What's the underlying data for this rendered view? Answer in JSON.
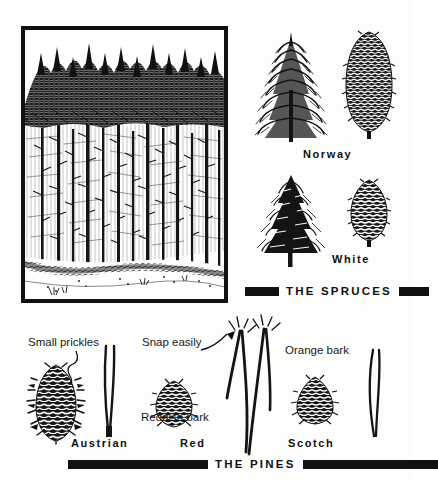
{
  "figure": {
    "kind": "field-guide-plate",
    "sections": [
      {
        "id": "spruces",
        "banner_text": "THE SPRUCES",
        "entries": [
          {
            "name": "Norway",
            "has_tree": true,
            "has_cone": true,
            "cone_shape": "long-cylindrical"
          },
          {
            "name": "White",
            "has_tree": true,
            "has_cone": true,
            "cone_shape": "short-ovoid"
          }
        ]
      },
      {
        "id": "pines",
        "banner_text": "THE PINES",
        "entries": [
          {
            "name": "Austrian",
            "has_cone": true,
            "has_needles": true,
            "annotation": "Small prickles"
          },
          {
            "name": "Red",
            "has_cone": true,
            "has_needles": true,
            "annotation": "Snap easily",
            "annotation2": "Reddish bark"
          },
          {
            "name": "Scotch",
            "has_cone": true,
            "has_needles": true,
            "annotation": "Orange bark"
          }
        ]
      }
    ]
  },
  "panel": {
    "name": "forest-stand-illustration",
    "caption": ""
  },
  "labels": {
    "norway": "Norway",
    "white": "White",
    "spruces_banner": "THE SPRUCES",
    "pines_banner": "THE PINES",
    "small_prickles": "Small prickles",
    "snap_easily": "Snap easily",
    "reddish_bark": "Reddish bark",
    "orange_bark": "Orange bark",
    "austrian": "Austrian",
    "red": "Red",
    "scotch": "Scotch"
  },
  "colors": {
    "ink": "#111111",
    "paper": "#fdfdfb"
  }
}
